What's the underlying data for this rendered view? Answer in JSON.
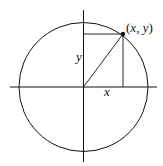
{
  "diagram": {
    "colors": {
      "stroke": "#111111",
      "background": "#ffffff"
    },
    "center": {
      "cx": 83.5,
      "cy": 87
    },
    "radius": 64.5,
    "axes": {
      "horizontal": {
        "x1": 10,
        "x2": 157,
        "y": 87
      },
      "vertical": {
        "x": 83.5,
        "y1": 10,
        "y2": 162
      }
    },
    "point": {
      "x": 123,
      "y": 34,
      "label": "(x, y)"
    },
    "labels": {
      "x_leg": "x",
      "y_leg": "y",
      "point_open": "(",
      "point_x": "x",
      "point_comma": ", ",
      "point_y": "y",
      "point_close": ")"
    }
  }
}
